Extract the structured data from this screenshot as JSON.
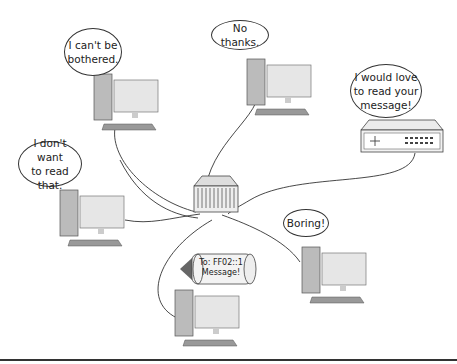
{
  "diagram": {
    "bubbles": [
      {
        "id": "pc-top-left",
        "text": "I can't be\nbothered."
      },
      {
        "id": "pc-top-center",
        "text": "No thanks."
      },
      {
        "id": "router",
        "text": "I would love\nto read your\nmessage!"
      },
      {
        "id": "pc-left",
        "text": "I don't want\nto read that."
      },
      {
        "id": "pc-right",
        "text": "Boring!"
      }
    ],
    "message_capsule": {
      "text": "To: FF02::1\nMessage!"
    },
    "nodes": [
      "pc-top-left",
      "pc-top-center",
      "router",
      "pc-left",
      "pc-right",
      "pc-bottom-sender",
      "hub"
    ],
    "colors": {
      "line": "#333333",
      "device": "#bdbdbd",
      "screen": "#e8e8e8"
    }
  }
}
